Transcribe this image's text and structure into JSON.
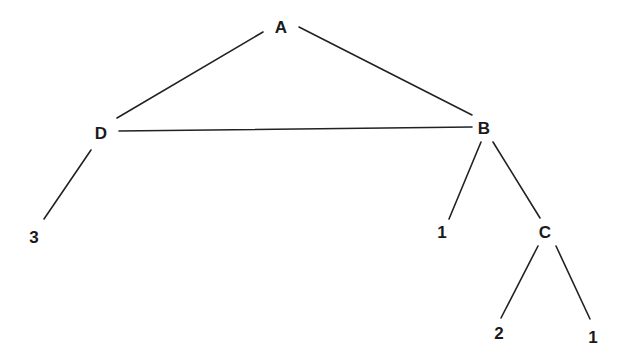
{
  "diagram": {
    "type": "graph",
    "background": "#ffffff",
    "line_color": "#222222",
    "nodes": [
      {
        "id": "A",
        "label": "A",
        "x": 281,
        "y": 27
      },
      {
        "id": "D",
        "label": "D",
        "x": 101,
        "y": 133
      },
      {
        "id": "B",
        "label": "B",
        "x": 484,
        "y": 128
      },
      {
        "id": "leafD3",
        "label": "3",
        "x": 34,
        "y": 237
      },
      {
        "id": "leafB1",
        "label": "1",
        "x": 442,
        "y": 232
      },
      {
        "id": "C",
        "label": "C",
        "x": 545,
        "y": 232
      },
      {
        "id": "leafC2",
        "label": "2",
        "x": 499,
        "y": 333
      },
      {
        "id": "leafC1",
        "label": "1",
        "x": 593,
        "y": 337
      }
    ],
    "edges": [
      {
        "from": "A",
        "to": "D",
        "x1": 263,
        "y1": 32,
        "x2": 117,
        "y2": 118
      },
      {
        "from": "A",
        "to": "B",
        "x1": 299,
        "y1": 27,
        "x2": 472,
        "y2": 115
      },
      {
        "from": "D",
        "to": "B",
        "x1": 119,
        "y1": 131,
        "x2": 472,
        "y2": 127
      },
      {
        "from": "D",
        "to": "leafD3",
        "x1": 91,
        "y1": 150,
        "x2": 44,
        "y2": 219
      },
      {
        "from": "B",
        "to": "leafB1",
        "x1": 481,
        "y1": 142,
        "x2": 449,
        "y2": 219
      },
      {
        "from": "B",
        "to": "C",
        "x1": 493,
        "y1": 142,
        "x2": 540,
        "y2": 218
      },
      {
        "from": "C",
        "to": "leafC2",
        "x1": 538,
        "y1": 246,
        "x2": 501,
        "y2": 318
      },
      {
        "from": "C",
        "to": "leafC1",
        "x1": 556,
        "y1": 246,
        "x2": 590,
        "y2": 319
      }
    ]
  }
}
